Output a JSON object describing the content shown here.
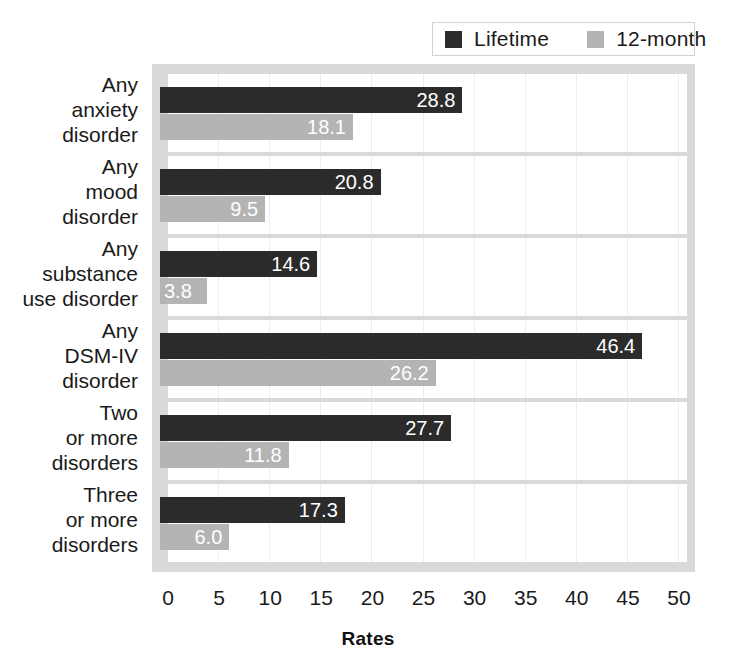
{
  "legend": {
    "position": "top-right",
    "entries": [
      {
        "label": "Lifetime",
        "color": "#2b2b2b",
        "swatch": "legend-swatch-lifetime"
      },
      {
        "label": "12-month",
        "color": "#b4b4b4",
        "swatch": "legend-swatch-12-month"
      }
    ]
  },
  "axis": {
    "x_title": "Rates",
    "ticks": [
      "0",
      "5",
      "10",
      "15",
      "20",
      "25",
      "30",
      "35",
      "40",
      "45",
      "50"
    ]
  },
  "chart_data": {
    "type": "bar",
    "orientation": "horizontal",
    "title": "",
    "subtitle": "",
    "xlabel": "Rates",
    "ylabel": "",
    "xlim": [
      0,
      50
    ],
    "xticks": [
      0,
      5,
      10,
      15,
      20,
      25,
      30,
      35,
      40,
      45,
      50
    ],
    "grid": true,
    "legend_position": "top-right",
    "categories": [
      "Any anxiety disorder",
      "Any mood disorder",
      "Any substance use disorder",
      "Any DSM-IV disorder",
      "Two or more disorders",
      "Three or more disorders"
    ],
    "category_lines": [
      [
        "Any",
        "anxiety",
        "disorder"
      ],
      [
        "Any",
        "mood",
        "disorder"
      ],
      [
        "Any",
        "substance",
        "use disorder"
      ],
      [
        "Any",
        "DSM-IV",
        "disorder"
      ],
      [
        "Two",
        "or more",
        "disorders"
      ],
      [
        "Three",
        "or more",
        "disorders"
      ]
    ],
    "series": [
      {
        "name": "Lifetime",
        "color": "#2b2b2b",
        "values": [
          28.8,
          20.8,
          14.6,
          46.4,
          27.7,
          17.3
        ],
        "labels": [
          "28.8",
          "20.8",
          "14.6",
          "46.4",
          "27.7",
          "17.3"
        ]
      },
      {
        "name": "12-month",
        "color": "#b4b4b4",
        "values": [
          18.1,
          9.5,
          3.8,
          26.2,
          11.8,
          6.0
        ],
        "labels": [
          "18.1",
          "9.5",
          "3.8",
          "26.2",
          "11.8",
          "6.0"
        ]
      }
    ]
  }
}
